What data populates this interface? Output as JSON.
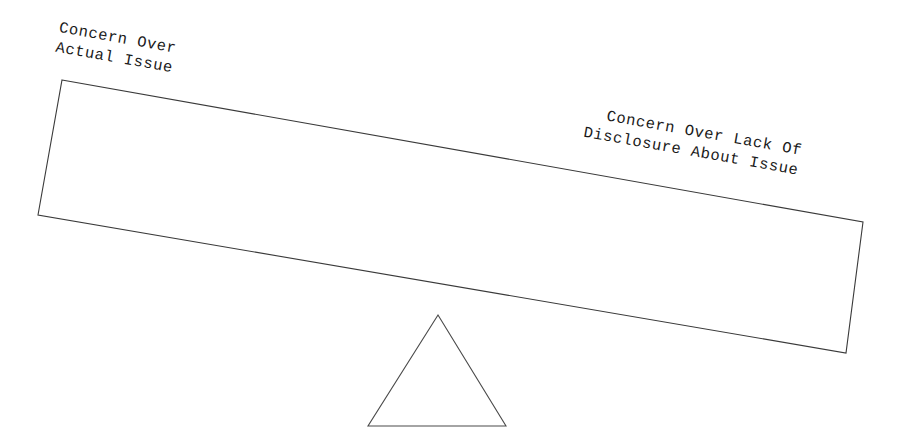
{
  "diagram": {
    "type": "seesaw-balance",
    "background_color": "#ffffff",
    "line_color": "#3a3a3a",
    "text_color": "#1a1a1a",
    "tilt_degrees": 10.1,
    "beam": {
      "name": "lever-beam",
      "points": "62,80 863,222 846,353 38,215",
      "fill": "#ffffff",
      "stroke": "#3a3a3a"
    },
    "fulcrum": {
      "name": "triangle-fulcrum",
      "points": "438,315 506,426 368,426",
      "fill": "#ffffff",
      "stroke": "#4a4a4a"
    },
    "labels": {
      "left": {
        "line1": "Concern Over",
        "line2": "Actual Issue"
      },
      "right": {
        "line1": "Concern Over Lack Of",
        "line2": "Disclosure About Issue"
      }
    }
  }
}
